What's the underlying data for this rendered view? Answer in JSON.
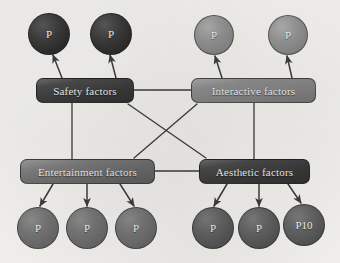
{
  "diagram": {
    "background_color": "#f2f1ee",
    "edge_color": "#3c3c3c",
    "boxes": [
      {
        "id": "safety",
        "label": "Safety factors",
        "x": 36,
        "y": 78,
        "w": 98,
        "h": 25,
        "shade": "box-dark"
      },
      {
        "id": "interactive",
        "label": "Interactive factors",
        "x": 191,
        "y": 78,
        "w": 125,
        "h": 25,
        "shade": "box-light"
      },
      {
        "id": "entertainment",
        "label": "Entertainment factors",
        "x": 20,
        "y": 159,
        "w": 135,
        "h": 25,
        "shade": "box-mid"
      },
      {
        "id": "aesthetic",
        "label": "Aesthetic factors",
        "x": 199,
        "y": 159,
        "w": 111,
        "h": 25,
        "shade": "box-dark"
      }
    ],
    "circles": [
      {
        "id": "p1",
        "label": "P",
        "cx": 49,
        "cy": 34,
        "r": 21,
        "shade": "circ-dark"
      },
      {
        "id": "p2",
        "label": "P",
        "cx": 111,
        "cy": 34,
        "r": 21,
        "shade": "circ-dark"
      },
      {
        "id": "p3",
        "label": "P",
        "cx": 214,
        "cy": 35,
        "r": 20,
        "shade": "circ-light"
      },
      {
        "id": "p4",
        "label": "P",
        "cx": 288,
        "cy": 35,
        "r": 20,
        "shade": "circ-light"
      },
      {
        "id": "p5",
        "label": "P",
        "cx": 38,
        "cy": 228,
        "r": 21,
        "shade": "circ-mid"
      },
      {
        "id": "p6",
        "label": "P",
        "cx": 87,
        "cy": 228,
        "r": 21,
        "shade": "circ-mid"
      },
      {
        "id": "p7",
        "label": "P",
        "cx": 136,
        "cy": 228,
        "r": 21,
        "shade": "circ-mid"
      },
      {
        "id": "p8",
        "label": "P",
        "cx": 213,
        "cy": 228,
        "r": 21,
        "shade": "circ-mid-dark"
      },
      {
        "id": "p9",
        "label": "P",
        "cx": 259,
        "cy": 228,
        "r": 21,
        "shade": "circ-mid-dark"
      },
      {
        "id": "p10",
        "label": "P10",
        "cx": 304,
        "cy": 225,
        "r": 21,
        "shade": "circ-mid-dark"
      }
    ],
    "edges": [
      {
        "id": "safety-interactive",
        "from": "safety",
        "to": "interactive",
        "arrow": false,
        "x1": 134,
        "y1": 90,
        "x2": 191,
        "y2": 90
      },
      {
        "id": "entertainment-aesthetic",
        "from": "entertainment",
        "to": "aesthetic",
        "arrow": false,
        "x1": 155,
        "y1": 171,
        "x2": 199,
        "y2": 171
      },
      {
        "id": "safety-entertainment",
        "from": "safety",
        "to": "entertainment",
        "arrow": false,
        "x1": 72,
        "y1": 103,
        "x2": 72,
        "y2": 159
      },
      {
        "id": "interactive-aesthetic",
        "from": "interactive",
        "to": "aesthetic",
        "arrow": false,
        "x1": 254,
        "y1": 103,
        "x2": 254,
        "y2": 159
      },
      {
        "id": "safety-aesthetic",
        "from": "safety",
        "to": "aesthetic",
        "arrow": false,
        "x1": 128,
        "y1": 104,
        "x2": 206,
        "y2": 158
      },
      {
        "id": "interactive-entertainment",
        "from": "interactive",
        "to": "entertainment",
        "arrow": false,
        "x1": 197,
        "y1": 104,
        "x2": 134,
        "y2": 158
      },
      {
        "id": "safety-p1",
        "from": "safety",
        "to": "p1",
        "arrow": true,
        "x1": 62,
        "y1": 78,
        "x2": 53,
        "y2": 55
      },
      {
        "id": "safety-p2",
        "from": "safety",
        "to": "p2",
        "arrow": true,
        "x1": 116,
        "y1": 78,
        "x2": 110,
        "y2": 55
      },
      {
        "id": "interactive-p3",
        "from": "interactive",
        "to": "p3",
        "arrow": true,
        "x1": 222,
        "y1": 78,
        "x2": 215,
        "y2": 56
      },
      {
        "id": "interactive-p4",
        "from": "interactive",
        "to": "p4",
        "arrow": true,
        "x1": 292,
        "y1": 78,
        "x2": 287,
        "y2": 56
      },
      {
        "id": "entertainment-p5",
        "from": "entertainment",
        "to": "p5",
        "arrow": true,
        "x1": 53,
        "y1": 184,
        "x2": 40,
        "y2": 206
      },
      {
        "id": "entertainment-p6",
        "from": "entertainment",
        "to": "p6",
        "arrow": true,
        "x1": 87,
        "y1": 184,
        "x2": 87,
        "y2": 206
      },
      {
        "id": "entertainment-p7",
        "from": "entertainment",
        "to": "p7",
        "arrow": true,
        "x1": 120,
        "y1": 184,
        "x2": 134,
        "y2": 206
      },
      {
        "id": "aesthetic-p8",
        "from": "aesthetic",
        "to": "p8",
        "arrow": true,
        "x1": 227,
        "y1": 184,
        "x2": 214,
        "y2": 206
      },
      {
        "id": "aesthetic-p9",
        "from": "aesthetic",
        "to": "p9",
        "arrow": true,
        "x1": 259,
        "y1": 184,
        "x2": 259,
        "y2": 206
      },
      {
        "id": "aesthetic-p10",
        "from": "aesthetic",
        "to": "p10",
        "arrow": true,
        "x1": 288,
        "y1": 184,
        "x2": 301,
        "y2": 203
      }
    ]
  }
}
